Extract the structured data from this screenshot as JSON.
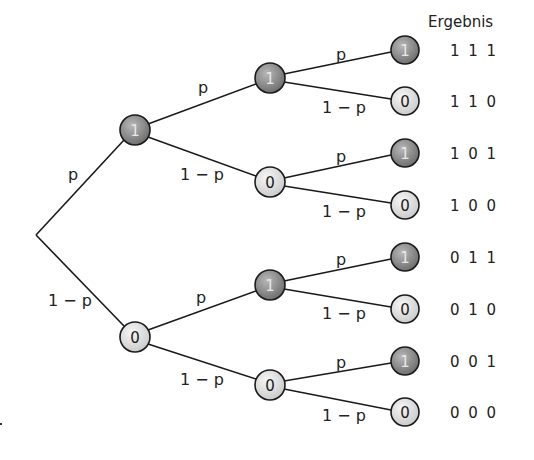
{
  "header": {
    "result_column_title": "Ergebnis"
  },
  "edge_labels": {
    "success": "p",
    "failure": "1 − p"
  },
  "colors": {
    "node_one_fill": "#8a8a8a",
    "node_zero_fill": "#e6e6e6",
    "edge": "#1a1a1a"
  },
  "root": {
    "x": 36,
    "y": 235
  },
  "level1": [
    {
      "value": "1",
      "x": 135,
      "y": 130
    },
    {
      "value": "0",
      "x": 135,
      "y": 337
    }
  ],
  "level2": [
    {
      "value": "1",
      "x": 270,
      "y": 78
    },
    {
      "value": "0",
      "x": 270,
      "y": 182
    },
    {
      "value": "1",
      "x": 270,
      "y": 285
    },
    {
      "value": "0",
      "x": 270,
      "y": 385
    }
  ],
  "leaves": [
    {
      "value": "1",
      "y": 50,
      "result": "1 1 1"
    },
    {
      "value": "0",
      "y": 101,
      "result": "1 1 0"
    },
    {
      "value": "1",
      "y": 153,
      "result": "1 0 1"
    },
    {
      "value": "0",
      "y": 205,
      "result": "1 0 0"
    },
    {
      "value": "1",
      "y": 257,
      "result": "0 1 1"
    },
    {
      "value": "0",
      "y": 309,
      "result": "0 1 0"
    },
    {
      "value": "1",
      "y": 361,
      "result": "0 0 1"
    },
    {
      "value": "0",
      "y": 412,
      "result": "0 0 0"
    }
  ]
}
